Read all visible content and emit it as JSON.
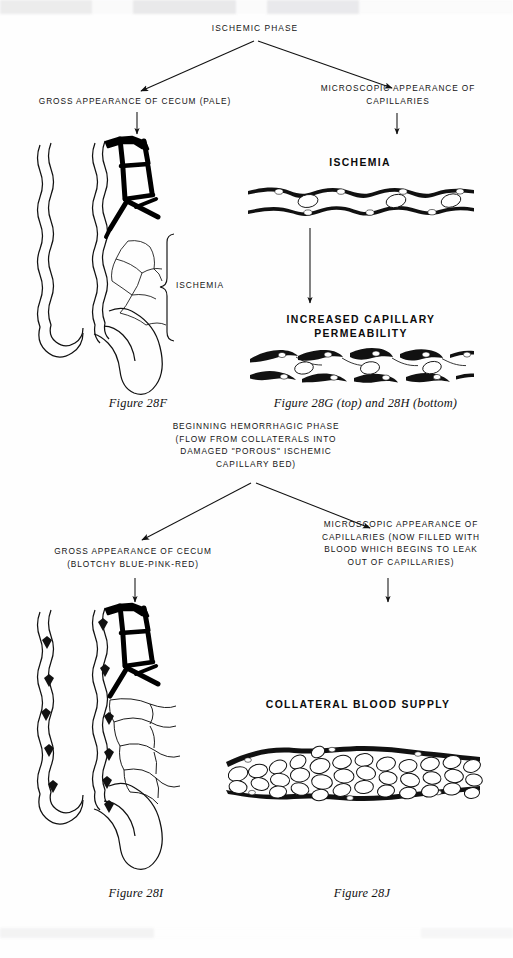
{
  "figure": {
    "root_label": "ISCHEMIC PHASE"
  },
  "ischemic_phase": {
    "root": "ISCHEMIC PHASE",
    "left_branch_label": "GROSS APPEARANCE OF CECUM (PALE)",
    "right_branch_label": "MICROSCOPIC APPEARANCE OF\nCAPILLARIES",
    "bracket_label": "ISCHEMIA",
    "capillary_top_label": "ISCHEMIA",
    "capillary_bottom_label": "INCREASED CAPILLARY\nPERMEABILITY",
    "caption_left": "Figure 28F",
    "caption_right_prefix": "Figure 28G",
    "caption_right_mid": "(top)",
    "caption_right_and": "and",
    "caption_right_suffix": "28H",
    "caption_right_end": "(bottom)",
    "caption_right_full": "Figure 28G (top) and 28H (bottom)"
  },
  "hemorrhagic_phase": {
    "root_label": "BEGINNING HEMORRHAGIC PHASE\n(FLOW FROM COLLATERALS INTO\nDAMAGED \"POROUS\" ISCHEMIC\nCAPILLARY BED)",
    "left_branch_label": "GROSS APPEARANCE OF CECUM\n(BLOTCHY BLUE-PINK-RED)",
    "right_branch_label": "MICROSCOPIC APPEARANCE OF\nCAPILLARIES (NOW FILLED WITH\nBLOOD WHICH BEGINS TO LEAK\nOUT OF CAPILLARIES)",
    "collateral_label": "COLLATERAL BLOOD\nSUPPLY",
    "caption_left": "Figure 28I",
    "caption_right": "Figure 28J"
  },
  "colors": {
    "ink": "#111111",
    "vessel_patent": "#000000",
    "vessel_ischemic": "#9a9a9a",
    "paper": "#fefefe"
  }
}
